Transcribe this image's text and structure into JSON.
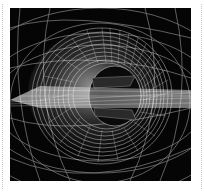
{
  "image": {
    "subject": "wireframe torus / spiral mesh artwork",
    "alt": "White wireframe 3D torus-like spiral surface on black background with a horizontal ribbon passing through its center",
    "colors": {
      "background": "#050505",
      "wire": "#ffffff",
      "page": "#ffffff",
      "rule": "#c8c8c8"
    }
  }
}
